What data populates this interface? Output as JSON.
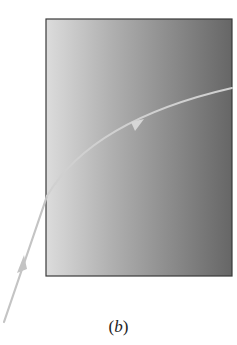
{
  "figure": {
    "caption_open": "(",
    "caption_letter": "b",
    "caption_close": ")"
  },
  "medium": {
    "x": 46,
    "y": 19,
    "width": 186,
    "height": 257,
    "gradient_left_color": "#dcdcdc",
    "gradient_right_color": "#6a6a6a",
    "border_color": "#3a3a3a"
  },
  "ray": {
    "color": "#c8c8c8",
    "incident_start": [
      4,
      322
    ],
    "entry_point": [
      47,
      196
    ],
    "curve_control": [
      90,
      120
    ],
    "exit_point": [
      232,
      88
    ],
    "arrow_incident_at": [
      22,
      262
    ],
    "arrow_inside_at": [
      137,
      124
    ]
  }
}
